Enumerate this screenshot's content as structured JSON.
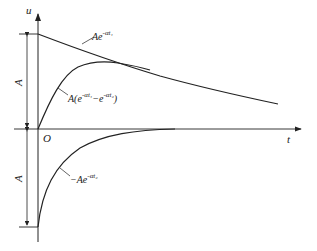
{
  "diagram": {
    "axes": {
      "y_label": "u",
      "x_label": "t",
      "origin_label": "O"
    },
    "dimensions": {
      "upper_label": "A",
      "lower_label": "A"
    },
    "curves": [
      {
        "id": "upper-decay",
        "label_base": "Ae",
        "label_sup": "-αt₁"
      },
      {
        "id": "difference",
        "label_prefix": "A(e",
        "label_sup1": "-αt₁",
        "label_mid": "−e",
        "label_sup2": "-αt₂",
        "label_suffix": ")"
      },
      {
        "id": "lower-decay",
        "label_base": "−Ae",
        "label_sup": "-αt₂"
      }
    ],
    "colors": {
      "line": "#222222",
      "background": "#ffffff"
    }
  }
}
